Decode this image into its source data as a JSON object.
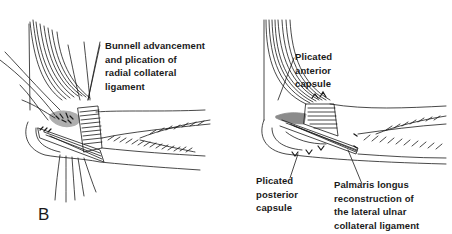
{
  "figure": {
    "panel_letter": "B",
    "left_panel": {
      "description": "Elbow lateral view with radial collateral ligament advancement",
      "label": {
        "lines": [
          "Bunnell advancement",
          "and plication of",
          "radial collateral",
          "ligament"
        ]
      }
    },
    "right_panel": {
      "description": "Elbow lateral view with palmaris longus ligament reconstruction",
      "labels": {
        "anterior": {
          "lines": [
            "Plicated",
            "anterior",
            "capsule"
          ]
        },
        "posterior": {
          "lines": [
            "Plicated",
            "posterior",
            "capsule"
          ]
        },
        "palmaris": {
          "lines": [
            "Palmaris longus",
            "reconstruction of",
            "the lateral ulnar",
            "collateral ligament"
          ]
        }
      }
    },
    "colors": {
      "ink": "#1a1a1a",
      "background": "#ffffff"
    }
  }
}
